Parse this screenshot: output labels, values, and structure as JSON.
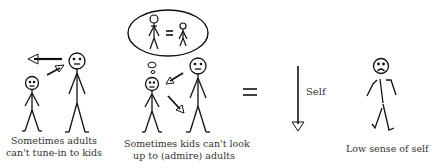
{
  "panels": [
    {
      "id": "adults-tune-in",
      "caption_lines": [
        "Sometimes adults",
        "can't tune-in to kids"
      ]
    },
    {
      "id": "kids-look-up",
      "caption_lines": [
        "Sometimes  kids can't  look",
        "up to (admire) adults"
      ],
      "thought_bubble": "adult = kid"
    },
    {
      "id": "equals",
      "symbol": "="
    },
    {
      "id": "self-arrow",
      "label": "Self",
      "direction": "down"
    },
    {
      "id": "low-self",
      "caption_lines": [
        "Low sense of self"
      ]
    }
  ],
  "colors": {
    "stroke": "#111111",
    "text": "#333333",
    "background": "#ffffff"
  }
}
